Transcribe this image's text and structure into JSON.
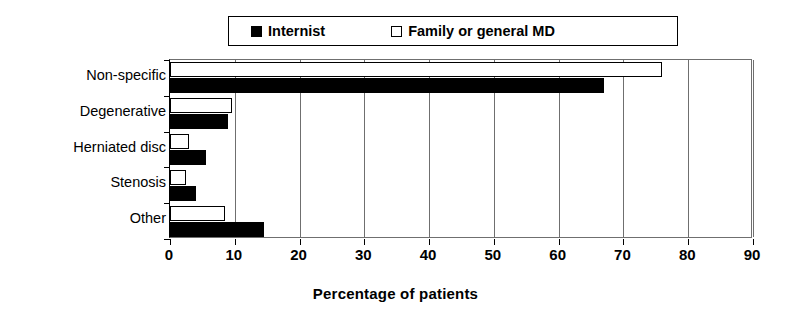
{
  "chart_data": {
    "type": "bar",
    "orientation": "horizontal",
    "title": "",
    "xlabel": "Percentage of patients",
    "ylabel": "",
    "xlim": [
      0,
      90
    ],
    "xticks": [
      0,
      10,
      20,
      30,
      40,
      50,
      60,
      70,
      80,
      90
    ],
    "grid": true,
    "legend_position": "top",
    "categories": [
      "Non-specific",
      "Degenerative",
      "Herniated disc",
      "Stenosis",
      "Other"
    ],
    "series": [
      {
        "name": "Internist",
        "marker": "filled-square",
        "color": "#000000",
        "values": [
          67,
          9,
          5.5,
          4,
          14.5
        ]
      },
      {
        "name": "Family or general MD",
        "marker": "hollow-square",
        "color": "#ffffff",
        "values": [
          76,
          9.5,
          3,
          2.5,
          8.5
        ]
      }
    ]
  },
  "legend": {
    "entries": [
      {
        "label": "Internist",
        "swatch": "filled-square-icon"
      },
      {
        "label": "Family or general MD",
        "swatch": "hollow-square-icon"
      }
    ]
  },
  "axis": {
    "x_title": "Percentage of patients",
    "x_tick_labels": [
      "0",
      "10",
      "20",
      "30",
      "40",
      "50",
      "60",
      "70",
      "80",
      "90"
    ],
    "y_tick_labels": [
      "Non-specific",
      "Degenerative",
      "Herniated disc",
      "Stenosis",
      "Other"
    ]
  },
  "colors": {
    "series_internist": "#000000",
    "series_family": "#ffffff",
    "axis": "#000000",
    "grid": "#6f6f6f",
    "background": "#ffffff"
  }
}
